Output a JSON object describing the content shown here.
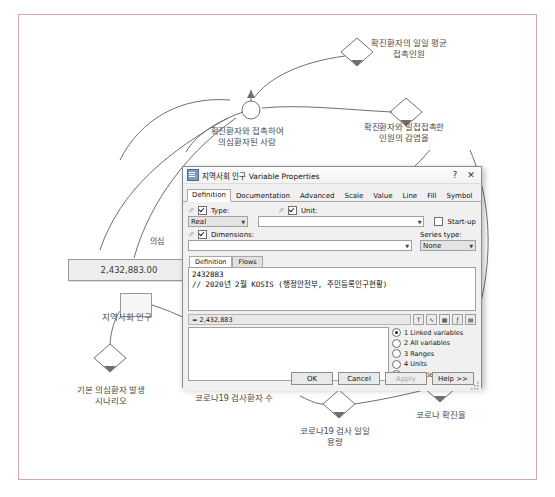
{
  "diagram": {
    "labels": [
      {
        "name": "avg-daily-contacts",
        "text": "확진환자의 일일 평균\n접촉인원"
      },
      {
        "name": "suspected-from-contact",
        "text": "확진환자와 접촉하여\n의심환자된 사람"
      },
      {
        "name": "close-contact-infection-rate",
        "text": "확진환자와 밀접접촉한\n인원의 감염율"
      },
      {
        "name": "community-population",
        "text": "지역사회 인구"
      },
      {
        "name": "base-suspected-scenario",
        "text": "기본 의심환자 발생\n시나리오"
      },
      {
        "name": "covid19-tested-count",
        "text": "코로나19 검사환자 수"
      },
      {
        "name": "covid19-daily-test-capacity",
        "text": "코로나19 검사 일일\n용량"
      },
      {
        "name": "covid-positive-rate",
        "text": "코로나 확진율"
      },
      {
        "name": "occluded-left-label",
        "text": "의심"
      }
    ],
    "stock_value": "2,432,883.00"
  },
  "dialog": {
    "title": "지역사회 인구 Variable Properties",
    "help_button": "?",
    "close_button": "✕",
    "tabs": [
      {
        "label": "Definition",
        "active": true
      },
      {
        "label": "Documentation",
        "active": false
      },
      {
        "label": "Advanced",
        "active": false
      },
      {
        "label": "Scale",
        "active": false
      },
      {
        "label": "Value",
        "active": false
      },
      {
        "label": "Line",
        "active": false
      },
      {
        "label": "Fill",
        "active": false
      },
      {
        "label": "Symbol",
        "active": false
      }
    ],
    "type": {
      "label": "Type:",
      "value": "Real",
      "checked": true
    },
    "unit": {
      "label": "Unit:",
      "value": "",
      "checked": true
    },
    "startup": {
      "label": "Start-up",
      "checked": false
    },
    "dimensions": {
      "label": "Dimensions:",
      "value": "",
      "checked": true
    },
    "series_type": {
      "label": "Series type:",
      "value": "None"
    },
    "definition_tabs": [
      {
        "label": "Definition",
        "active": true
      },
      {
        "label": "Flows",
        "active": false
      }
    ],
    "equation_text": "2432883\n// 2020년 2월 KOSIS (행정안전부, 주민등록인구현황)",
    "evaluated_value": "= 2,432,883",
    "mini_buttons": [
      "T",
      "curve-icon",
      "matrix-icon",
      "f-icon",
      "table-icon"
    ],
    "radio_options": [
      {
        "label": "1 Linked variables",
        "selected": true
      },
      {
        "label": "2 All variables",
        "selected": false
      },
      {
        "label": "3 Ranges",
        "selected": false
      },
      {
        "label": "4 Units",
        "selected": false
      },
      {
        "label": "5 Functions",
        "selected": false
      }
    ],
    "buttons": [
      {
        "label": "OK",
        "disabled": false
      },
      {
        "label": "Cancel",
        "disabled": false
      },
      {
        "label": "Apply",
        "disabled": true
      },
      {
        "label": "Help >>",
        "disabled": false
      }
    ]
  },
  "colors": {
    "frame_border": "#d9a8a8",
    "diagram_stroke": "#6f6f6f",
    "label_text": "#4a4a4a",
    "dialog_face": "#f0f0f0"
  }
}
